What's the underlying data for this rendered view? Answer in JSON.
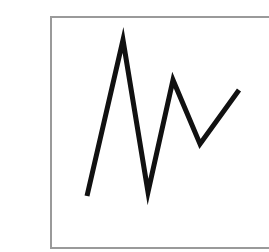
{
  "chart_data": {
    "type": "line",
    "title": "",
    "xlabel": "",
    "ylabel": "",
    "grid": false,
    "legend": null,
    "x": [
      0,
      1,
      2,
      3,
      4,
      5
    ],
    "series": [
      {
        "name": "",
        "values": [
          1,
          10,
          1.2,
          7,
          3.8,
          6.6
        ],
        "color": "#111111"
      }
    ],
    "pixel_points": [
      [
        87,
        196
      ],
      [
        123,
        40
      ],
      [
        148,
        192
      ],
      [
        173,
        80
      ],
      [
        200,
        144
      ],
      [
        239,
        90
      ]
    ],
    "ylim": [
      0,
      11
    ]
  },
  "frame": {
    "border_color": "#9a9a9a",
    "background": "#ffffff"
  }
}
